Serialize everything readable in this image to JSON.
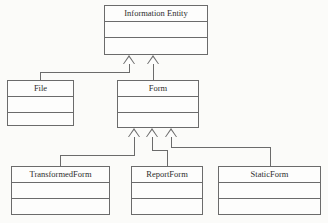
{
  "diagram": {
    "kind": "uml-class-diagram",
    "title": "",
    "colors": {
      "background": "#fbfbf9",
      "box_fill": "#fdfdfc",
      "line": "#6b6b6b",
      "text": "#2d2d2d"
    },
    "classes": [
      {
        "id": "information-entity",
        "name": "Information Entity",
        "attributes": [],
        "operations": [],
        "x": 104,
        "y": 5,
        "width": 104,
        "height": 50
      },
      {
        "id": "file",
        "name": "File",
        "attributes": [],
        "operations": [],
        "x": 7,
        "y": 80,
        "width": 67,
        "height": 46
      },
      {
        "id": "form",
        "name": "Form",
        "attributes": [],
        "operations": [],
        "x": 117,
        "y": 80,
        "width": 82,
        "height": 48
      },
      {
        "id": "transformedform",
        "name": "TransformedForm",
        "attributes": [],
        "operations": [],
        "x": 11,
        "y": 166,
        "width": 99,
        "height": 49
      },
      {
        "id": "reportform",
        "name": "ReportForm",
        "attributes": [],
        "operations": [],
        "x": 131,
        "y": 166,
        "width": 72,
        "height": 49
      },
      {
        "id": "staticform",
        "name": "StaticForm",
        "attributes": [],
        "operations": [],
        "x": 218,
        "y": 166,
        "width": 103,
        "height": 49
      }
    ],
    "generalizations": [
      {
        "child": "file",
        "parent": "information-entity",
        "type": "generalization"
      },
      {
        "child": "form",
        "parent": "information-entity",
        "type": "generalization"
      },
      {
        "child": "transformedform",
        "parent": "form",
        "type": "generalization"
      },
      {
        "child": "reportform",
        "parent": "form",
        "type": "generalization"
      },
      {
        "child": "staticform",
        "parent": "form",
        "type": "generalization"
      }
    ]
  }
}
